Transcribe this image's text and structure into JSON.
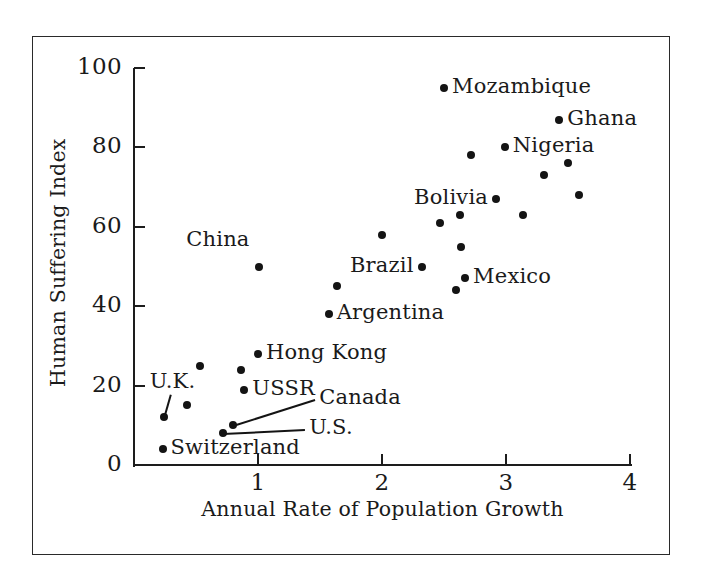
{
  "chart_data": {
    "type": "scatter",
    "title": "",
    "xlabel": "Annual Rate of Population Growth",
    "ylabel": "Human Suffering Index",
    "xlim": [
      0,
      4
    ],
    "ylim": [
      0,
      100
    ],
    "xticks": [
      "1",
      "2",
      "3",
      "4"
    ],
    "xtick_values": [
      1,
      2,
      3,
      4
    ],
    "yticks": [
      "0",
      "20",
      "40",
      "60",
      "80",
      "100"
    ],
    "ytick_values": [
      0,
      20,
      40,
      60,
      80,
      100
    ],
    "grid": false,
    "legend": "none",
    "marker_color": "#141414",
    "axis_color": "#1d1d1d",
    "points": [
      {
        "name": "Switzerland",
        "x": 0.23,
        "y": 4,
        "label": "Switzerland",
        "label_pos": "right"
      },
      {
        "name": "U.K.",
        "x": 0.24,
        "y": 12,
        "label": "U.K.",
        "label_pos": "leader-up"
      },
      {
        "name": "unlabeled-1",
        "x": 0.43,
        "y": 15,
        "label": "",
        "label_pos": "none"
      },
      {
        "name": "unlabeled-2",
        "x": 0.53,
        "y": 25,
        "label": "",
        "label_pos": "none"
      },
      {
        "name": "U.S.",
        "x": 0.72,
        "y": 8,
        "label": "U.S.",
        "label_pos": "leader-right"
      },
      {
        "name": "Canada",
        "x": 0.8,
        "y": 10,
        "label": "Canada",
        "label_pos": "leader-right"
      },
      {
        "name": "unlabeled-3",
        "x": 0.86,
        "y": 24,
        "label": "",
        "label_pos": "none"
      },
      {
        "name": "USSR",
        "x": 0.89,
        "y": 19,
        "label": "USSR",
        "label_pos": "right"
      },
      {
        "name": "Hong Kong",
        "x": 1.0,
        "y": 28,
        "label": "Hong Kong",
        "label_pos": "right"
      },
      {
        "name": "China",
        "x": 1.01,
        "y": 50,
        "label": "China",
        "label_pos": "above-left"
      },
      {
        "name": "Argentina",
        "x": 1.57,
        "y": 38,
        "label": "Argentina",
        "label_pos": "right"
      },
      {
        "name": "unlabeled-4",
        "x": 1.64,
        "y": 45,
        "label": "",
        "label_pos": "none"
      },
      {
        "name": "unlabeled-5",
        "x": 2.0,
        "y": 58,
        "label": "",
        "label_pos": "none"
      },
      {
        "name": "Brazil",
        "x": 2.32,
        "y": 50,
        "label": "Brazil",
        "label_pos": "left"
      },
      {
        "name": "unlabeled-6",
        "x": 2.47,
        "y": 61,
        "label": "",
        "label_pos": "none"
      },
      {
        "name": "Mozambique",
        "x": 2.5,
        "y": 95,
        "label": "Mozambique",
        "label_pos": "right"
      },
      {
        "name": "unlabeled-7",
        "x": 2.6,
        "y": 44,
        "label": "",
        "label_pos": "none"
      },
      {
        "name": "unlabeled-8",
        "x": 2.63,
        "y": 63,
        "label": "",
        "label_pos": "none"
      },
      {
        "name": "unlabeled-9",
        "x": 2.64,
        "y": 55,
        "label": "",
        "label_pos": "none"
      },
      {
        "name": "Mexico",
        "x": 2.67,
        "y": 47,
        "label": "Mexico",
        "label_pos": "right"
      },
      {
        "name": "unlabeled-10",
        "x": 2.72,
        "y": 78,
        "label": "",
        "label_pos": "none"
      },
      {
        "name": "Bolivia",
        "x": 2.92,
        "y": 67,
        "label": "Bolivia",
        "label_pos": "left"
      },
      {
        "name": "Nigeria",
        "x": 2.99,
        "y": 80,
        "label": "Nigeria",
        "label_pos": "right"
      },
      {
        "name": "unlabeled-11",
        "x": 3.14,
        "y": 63,
        "label": "",
        "label_pos": "none"
      },
      {
        "name": "unlabeled-12",
        "x": 3.31,
        "y": 73,
        "label": "",
        "label_pos": "none"
      },
      {
        "name": "Ghana",
        "x": 3.43,
        "y": 87,
        "label": "Ghana",
        "label_pos": "right"
      },
      {
        "name": "unlabeled-13",
        "x": 3.5,
        "y": 76,
        "label": "",
        "label_pos": "none"
      },
      {
        "name": "unlabeled-14",
        "x": 3.59,
        "y": 68,
        "label": "",
        "label_pos": "none"
      }
    ]
  }
}
